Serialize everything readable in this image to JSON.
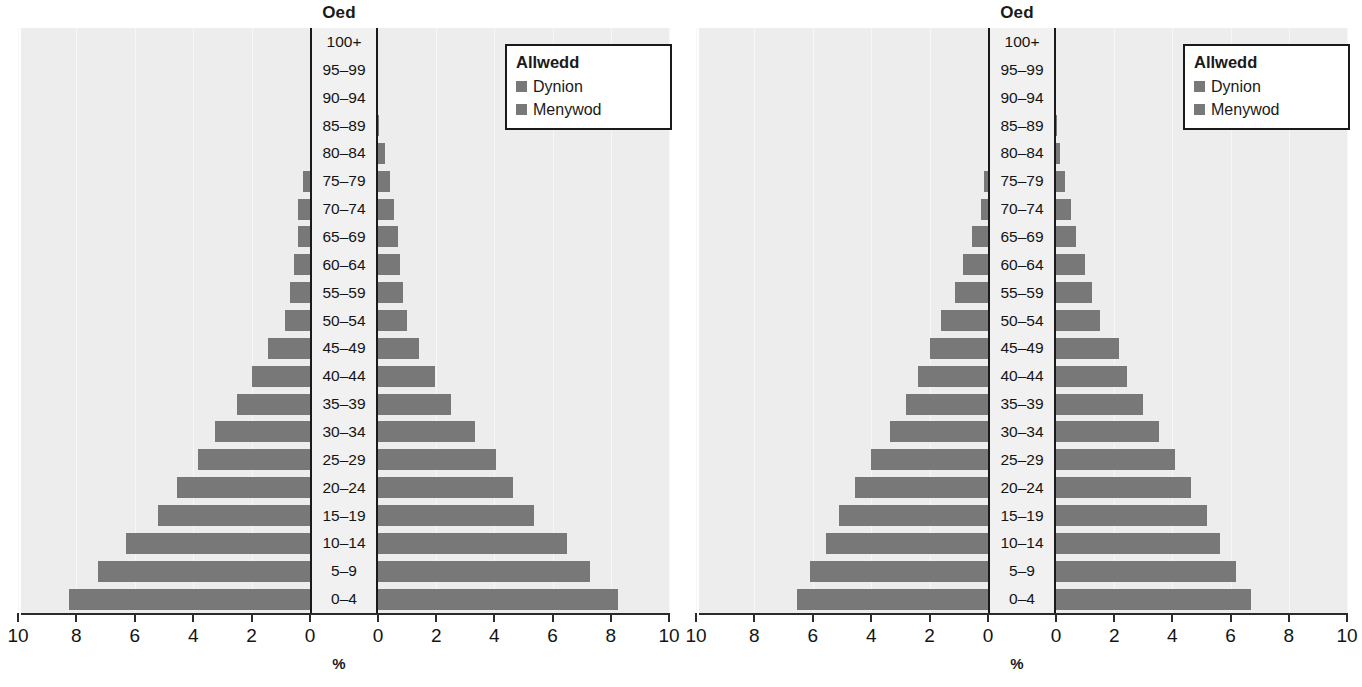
{
  "figure": {
    "unit_label": "%",
    "bar_color": "#787878",
    "panel_bg": "#ededed"
  },
  "charts": [
    {
      "id": "chart-left",
      "title": "Oed",
      "xlabel": "%",
      "legend": {
        "title": "Allwedd",
        "items": [
          {
            "label": "Dynion",
            "color": "#787878"
          },
          {
            "label": "Menywod",
            "color": "#787878"
          }
        ]
      },
      "axis": {
        "tick_labels": [
          "10",
          "8",
          "6",
          "4",
          "2",
          "0",
          "0",
          "2",
          "4",
          "6",
          "8",
          "10"
        ],
        "xlim": [
          0,
          10
        ],
        "xstep": 2
      }
    },
    {
      "id": "chart-right",
      "title": "Oed",
      "xlabel": "%",
      "legend": {
        "title": "Allwedd",
        "items": [
          {
            "label": "Dynion",
            "color": "#787878"
          },
          {
            "label": "Menywod",
            "color": "#787878"
          }
        ]
      },
      "axis": {
        "tick_labels": [
          "10",
          "8",
          "6",
          "4",
          "2",
          "0",
          "0",
          "2",
          "4",
          "6",
          "8",
          "10"
        ],
        "xlim": [
          0,
          10
        ],
        "xstep": 2
      }
    }
  ],
  "chart_data": [
    {
      "type": "bar",
      "subtype": "population-pyramid",
      "title": "Oed",
      "xlabel": "%",
      "ylabel": "Oed",
      "xlim": [
        0,
        10
      ],
      "xticks": [
        0,
        2,
        4,
        6,
        8,
        10
      ],
      "grid": true,
      "legend_position": "top-right",
      "categories": [
        "100+",
        "95–99",
        "90–94",
        "85–89",
        "80–84",
        "75–79",
        "70–74",
        "65–69",
        "60–64",
        "55–59",
        "50–54",
        "45–49",
        "40–44",
        "35–39",
        "30–34",
        "25–29",
        "20–24",
        "15–19",
        "10–14",
        "5–9",
        "0–4"
      ],
      "series": [
        {
          "name": "Dynion",
          "side": "left",
          "values": [
            0.0,
            0.0,
            0.0,
            0.05,
            0.1,
            0.35,
            0.5,
            0.5,
            0.65,
            0.8,
            0.95,
            1.55,
            2.1,
            2.6,
            3.35,
            3.95,
            4.65,
            5.3,
            6.4,
            7.35,
            8.35
          ]
        },
        {
          "name": "Menywod",
          "side": "right",
          "values": [
            0.0,
            0.0,
            0.0,
            0.05,
            0.25,
            0.4,
            0.55,
            0.7,
            0.75,
            0.85,
            1.0,
            1.4,
            1.95,
            2.5,
            3.35,
            4.05,
            4.65,
            5.35,
            6.5,
            7.3,
            8.25
          ]
        }
      ]
    },
    {
      "type": "bar",
      "subtype": "population-pyramid",
      "title": "Oed",
      "xlabel": "%",
      "ylabel": "Oed",
      "xlim": [
        0,
        10
      ],
      "xticks": [
        0,
        2,
        4,
        6,
        8,
        10
      ],
      "grid": true,
      "legend_position": "top-right",
      "categories": [
        "100+",
        "95–99",
        "90–94",
        "85–89",
        "80–84",
        "75–79",
        "70–74",
        "65–69",
        "60–64",
        "55–59",
        "50–54",
        "45–49",
        "40–44",
        "35–39",
        "30–34",
        "25–29",
        "20–24",
        "15–19",
        "10–14",
        "5–9",
        "0–4"
      ],
      "series": [
        {
          "name": "Dynion",
          "side": "left",
          "values": [
            0.0,
            0.0,
            0.0,
            0.05,
            0.1,
            0.25,
            0.35,
            0.65,
            0.95,
            1.25,
            1.7,
            2.1,
            2.5,
            2.9,
            3.45,
            4.1,
            4.65,
            5.2,
            5.65,
            6.2,
            6.65
          ]
        },
        {
          "name": "Menywod",
          "side": "right",
          "values": [
            0.0,
            0.0,
            0.0,
            0.05,
            0.15,
            0.3,
            0.5,
            0.7,
            1.0,
            1.25,
            1.5,
            2.15,
            2.45,
            3.0,
            3.55,
            4.1,
            4.65,
            5.2,
            5.65,
            6.2,
            6.7
          ]
        }
      ]
    }
  ]
}
